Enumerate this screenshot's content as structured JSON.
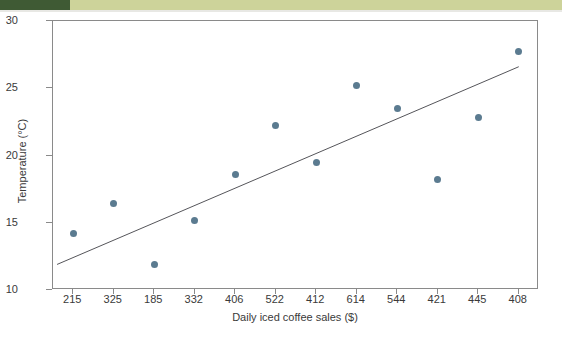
{
  "banner": {
    "dark_color": "#3f5a34",
    "light_color": "#cdd39a"
  },
  "chart_data": {
    "type": "scatter",
    "title": "",
    "xlabel": "Daily iced coffee sales ($)",
    "ylabel": "Temperature (°C)",
    "categories": [
      "215",
      "325",
      "185",
      "332",
      "406",
      "522",
      "412",
      "614",
      "544",
      "421",
      "445",
      "408"
    ],
    "values": [
      14.2,
      16.4,
      11.9,
      15.2,
      18.6,
      22.2,
      19.5,
      25.2,
      23.5,
      18.2,
      22.8,
      27.7
    ],
    "ylim": [
      10,
      30
    ],
    "yticks": [
      "10",
      "15",
      "20",
      "25",
      "30"
    ],
    "ytick_values": [
      10,
      15,
      20,
      25,
      30
    ],
    "grid": false,
    "legend": "none",
    "marker_color": "#5b7b90",
    "axis_color": "#8a8a8a",
    "trendline": {
      "type": "line-of-best-fit",
      "color": "#55555a",
      "start": {
        "category_index": -0.4,
        "value": 11.9
      },
      "end": {
        "category_index": 11.0,
        "value": 26.6
      }
    },
    "series": [
      {
        "name": "Temperature vs daily iced coffee sales",
        "points": [
          {
            "x_label": "215",
            "y": 14.2
          },
          {
            "x_label": "325",
            "y": 16.4
          },
          {
            "x_label": "185",
            "y": 11.9
          },
          {
            "x_label": "332",
            "y": 15.2
          },
          {
            "x_label": "406",
            "y": 18.6
          },
          {
            "x_label": "522",
            "y": 22.2
          },
          {
            "x_label": "412",
            "y": 19.5
          },
          {
            "x_label": "614",
            "y": 25.2
          },
          {
            "x_label": "544",
            "y": 23.5
          },
          {
            "x_label": "421",
            "y": 18.2
          },
          {
            "x_label": "445",
            "y": 22.8
          },
          {
            "x_label": "408",
            "y": 27.7
          }
        ]
      }
    ]
  }
}
